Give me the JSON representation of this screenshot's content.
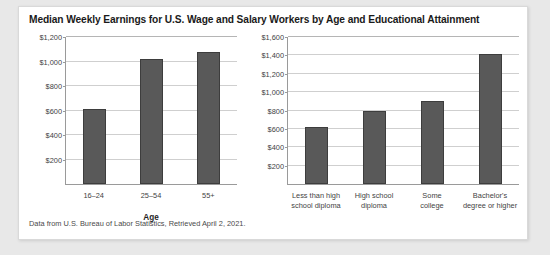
{
  "figure": {
    "title": "Median Weekly Earnings for U.S. Wage and Salary Workers by Age and Educational Attainment",
    "footnote": "Data from U.S. Bureau of Labor Statistics, Retrieved April 2, 2021.",
    "bar_color": "#595959",
    "bar_border_color": "#3d3d3d",
    "grid_color": "#cfcfcf",
    "axis_color": "#9a9a9a",
    "card_background": "#ffffff",
    "page_background": "#e8e8e8"
  },
  "chart_data": [
    {
      "type": "bar",
      "title": "Median Weekly Earnings for U.S. Wage and Salary Workers by Age and Educational Attainment",
      "panel": "left",
      "categories": [
        "16–24",
        "25–54",
        "55+"
      ],
      "values": [
        610,
        1020,
        1080
      ],
      "xlabel": "Age",
      "ylabel": "",
      "ylim": [
        0,
        1200
      ],
      "yticks": [
        0,
        200,
        400,
        600,
        800,
        1000,
        1200
      ],
      "ytick_labels": [
        "$0",
        "$200",
        "$400",
        "$600",
        "$800",
        "$1,000",
        "$1,200"
      ],
      "grid": true,
      "legend": "none"
    },
    {
      "type": "bar",
      "panel": "right",
      "categories": [
        "Less than high school diploma",
        "High school diploma",
        "Some college",
        "Bachelor's degree or higher"
      ],
      "category_lines": [
        [
          "Less than high",
          "school diploma"
        ],
        [
          "High school",
          "diploma"
        ],
        [
          "Some",
          "college"
        ],
        [
          "Bachelor's",
          "degree or higher"
        ]
      ],
      "values": [
        620,
        790,
        900,
        1420
      ],
      "xlabel": "",
      "ylabel": "",
      "ylim": [
        0,
        1600
      ],
      "yticks": [
        0,
        200,
        400,
        600,
        800,
        1000,
        1200,
        1400,
        1600
      ],
      "ytick_labels": [
        "$0",
        "$200",
        "$400",
        "$600",
        "$800",
        "$1,000",
        "$1,200",
        "$1,400",
        "$1,600"
      ],
      "grid": true,
      "legend": "none"
    }
  ]
}
